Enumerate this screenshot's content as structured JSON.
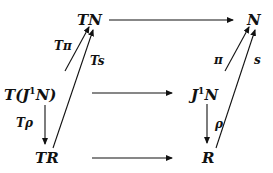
{
  "diagram": {
    "type": "commutative-diagram",
    "nodes": {
      "TN": "TN",
      "N": "N",
      "TJ1N_prefix": "T(J",
      "TJ1N_sup": "1",
      "TJ1N_suffix": "N)",
      "J1N_prefix": "J",
      "J1N_sup": "1",
      "J1N_suffix": "N",
      "TR": "TR",
      "R": "R"
    },
    "labels": {
      "T_pi": "Tπ",
      "T_s": "Ts",
      "T_rho": "Tρ",
      "pi": "π",
      "s": "s",
      "rho": "ρ"
    },
    "edges": [
      {
        "from": "TN",
        "to": "N",
        "label": ""
      },
      {
        "from": "T(J1N)",
        "to": "J1N",
        "label": ""
      },
      {
        "from": "TR",
        "to": "R",
        "label": ""
      },
      {
        "from": "T(J1N)",
        "to": "TN",
        "label": "Tπ"
      },
      {
        "from": "TR",
        "to": "TN",
        "label": "Ts"
      },
      {
        "from": "T(J1N)",
        "to": "TR",
        "label": "Tρ"
      },
      {
        "from": "J1N",
        "to": "N",
        "label": "π"
      },
      {
        "from": "R",
        "to": "N",
        "label": "s"
      },
      {
        "from": "J1N",
        "to": "R",
        "label": "ρ"
      }
    ],
    "colors": {
      "ink": "#111111",
      "background": "#ffffff"
    }
  }
}
